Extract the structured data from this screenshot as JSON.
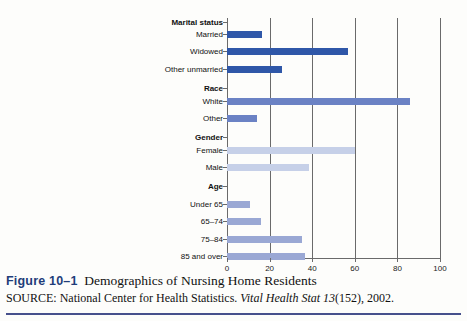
{
  "figure": {
    "number": "Figure 10–1",
    "title": "Demographics of Nursing Home Residents",
    "source_prefix": "SOURCE: National Center for Health Statistics.",
    "source_italic": "Vital Health Stat 13",
    "source_suffix": "(152), 2002."
  },
  "colors": {
    "marital": "#2f57a8",
    "race": "#6b82c4",
    "gender": "#c6d0e8",
    "age": "#9aa8d4",
    "axis": "#6a6a6a",
    "rule": "#46508c",
    "fig_number": "#1f3d7a"
  },
  "chart_data": {
    "type": "bar",
    "orientation": "horizontal",
    "title": "Demographics of Nursing Home Residents",
    "xlabel": "",
    "ylabel": "",
    "xlim": [
      0,
      100
    ],
    "xticks": [
      0,
      20,
      40,
      60,
      80,
      100
    ],
    "grid": true,
    "legend": "none",
    "groups": [
      {
        "name": "Marital status",
        "color": "#2f57a8",
        "categories": [
          "Married",
          "Widowed",
          "Other unmarried"
        ],
        "values": [
          16.5,
          57,
          26
        ]
      },
      {
        "name": "Race",
        "color": "#6b82c4",
        "categories": [
          "White",
          "Other"
        ],
        "values": [
          86,
          14
        ]
      },
      {
        "name": "Gender",
        "color": "#c6d0e8",
        "categories": [
          "Female",
          "Male"
        ],
        "values": [
          60,
          38.5
        ]
      },
      {
        "name": "Age",
        "color": "#9aa8d4",
        "categories": [
          "Under 65",
          "65–74",
          "75–84",
          "85 and over"
        ],
        "values": [
          11,
          16,
          35,
          36.5
        ]
      }
    ]
  }
}
